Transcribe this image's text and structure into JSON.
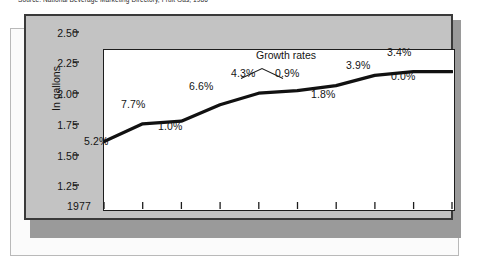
{
  "source_caption": "Source: National Beverage Marketing Directory, Fruit Gas, 1986",
  "axis": {
    "ylabel": "In gallons",
    "yticks": [
      "2.50",
      "2.25",
      "2.00",
      "1.75",
      "1.50",
      "1.25"
    ],
    "xticks": [
      "1977",
      "1978",
      "1979",
      "1980",
      "1981",
      "1982",
      "1983",
      "1984",
      "1985",
      "1986"
    ]
  },
  "annotation": {
    "label": "Growth rates"
  },
  "growth_labels": [
    "5.2%",
    "7.7%",
    "1.0%",
    "6.6%",
    "4.3%",
    "0.9%",
    "1.8%",
    "3.9%",
    "3.4%",
    "0.0%"
  ],
  "colors": {
    "line": "#111111",
    "plot_background": "#ffffff",
    "panel_gray": "#c3c3c3",
    "panel_border": "#3a3a3a",
    "panel_shadow": "#9a9a9a",
    "outer_panel": "#fbfbfb",
    "text": "#141414"
  },
  "chart_data": {
    "type": "line",
    "title": "",
    "subtitle": "",
    "xlabel": "",
    "ylabel": "In gallons",
    "x": [
      1977,
      1978,
      1979,
      1980,
      1981,
      1982,
      1983,
      1984,
      1985,
      1986
    ],
    "values": [
      1.78,
      1.92,
      1.94,
      2.07,
      2.16,
      2.18,
      2.22,
      2.3,
      2.33,
      2.33
    ],
    "growth_rates_pct": [
      5.2,
      7.7,
      1.0,
      6.6,
      4.3,
      0.9,
      1.8,
      3.9,
      3.4,
      0.0
    ],
    "point_labels": [
      "5.2%",
      "7.7%",
      "1.0%",
      "6.6%",
      "4.3%",
      "0.9%",
      "1.8%",
      "3.9%",
      "3.4%",
      "0.0%"
    ],
    "ylim": [
      1.25,
      2.5
    ],
    "ytick_values": [
      2.5,
      2.25,
      2.0,
      1.75,
      1.5,
      1.25
    ],
    "xlim": [
      1977,
      1986
    ],
    "grid": false,
    "legend": null,
    "annotations": [
      {
        "text": "Growth rates",
        "points_to": [
          "4.3%",
          "0.9%"
        ]
      }
    ]
  }
}
